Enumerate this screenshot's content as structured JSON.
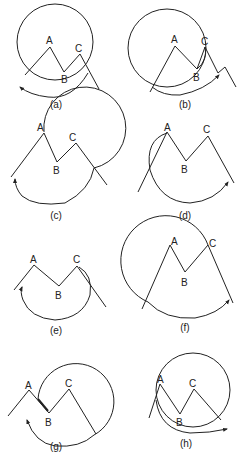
{
  "figure": {
    "panels": [
      {
        "caption": "(a)",
        "points": [
          "A",
          "B",
          "C"
        ],
        "arrow_direction": "counterclockwise-left"
      },
      {
        "caption": "(b)",
        "points": [
          "A",
          "B",
          "C"
        ],
        "arrow_direction": "clockwise-right"
      },
      {
        "caption": "(c)",
        "points": [
          "A",
          "B",
          "C"
        ],
        "arrow_direction": "counterclockwise-left"
      },
      {
        "caption": "(d)",
        "points": [
          "A",
          "B",
          "C"
        ],
        "arrow_direction": "clockwise-right"
      },
      {
        "caption": "(e)",
        "points": [
          "A",
          "B",
          "C"
        ],
        "arrow_direction": "counterclockwise-left"
      },
      {
        "caption": "(f)",
        "points": [
          "A",
          "B",
          "C"
        ],
        "arrow_direction": "clockwise-right"
      },
      {
        "caption": "(g)",
        "points": [
          "A",
          "B",
          "C"
        ],
        "arrow_direction": "counterclockwise-left"
      },
      {
        "caption": "(h)",
        "points": [
          "A",
          "B",
          "C"
        ],
        "arrow_direction": "clockwise-right"
      }
    ]
  },
  "colors": {
    "stroke": "#222222",
    "background": "#ffffff"
  }
}
